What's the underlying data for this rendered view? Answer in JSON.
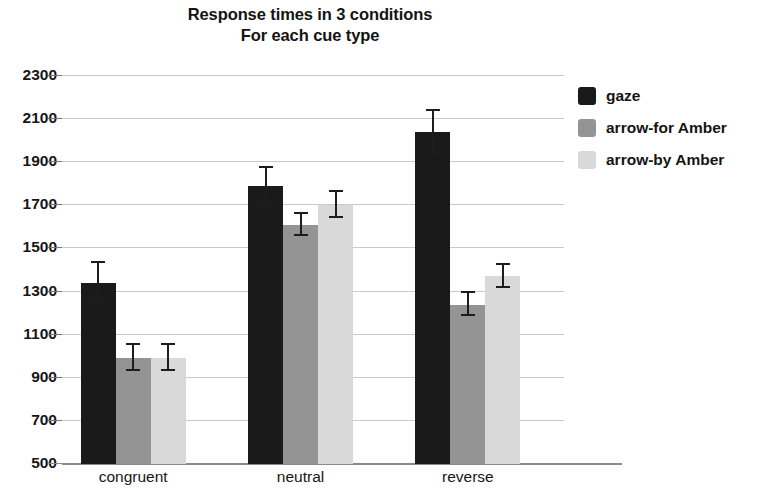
{
  "chart_data": {
    "type": "bar",
    "title": "Response times in 3 conditions",
    "subtitle": "For each cue type",
    "title_lines": [
      "Response times in 3 conditions",
      "For each cue type"
    ],
    "xlabel": "",
    "ylabel": "",
    "ylim": [
      500,
      2300
    ],
    "ytick_step": 200,
    "grid": true,
    "legend_position": "right",
    "categories": [
      "congruent",
      "neutral",
      "reverse"
    ],
    "yticks": [
      "2300",
      "2100",
      "1900",
      "1700",
      "1500",
      "1300",
      "1100",
      "900",
      "700",
      "500"
    ],
    "ytick_values": [
      2300,
      2100,
      1900,
      1700,
      1500,
      1300,
      1100,
      900,
      700,
      500
    ],
    "series": [
      {
        "name": "gaze",
        "color": "#1a1a1a",
        "values": [
          1340,
          1790,
          2040
        ],
        "errors": [
          95,
          90,
          100
        ]
      },
      {
        "name": "arrow-for Amber",
        "color": "#949494",
        "values": [
          990,
          1610,
          1240
        ],
        "errors": [
          65,
          55,
          60
        ]
      },
      {
        "name": "arrow-by Amber",
        "color": "#d9d9d9",
        "values": [
          990,
          1700,
          1370
        ],
        "errors": [
          65,
          65,
          60
        ]
      }
    ]
  },
  "legend": {
    "items": [
      {
        "label": "gaze",
        "color": "#1a1a1a"
      },
      {
        "label": "arrow-for Amber",
        "color": "#949494"
      },
      {
        "label": "arrow-by Amber",
        "color": "#d9d9d9"
      }
    ]
  }
}
